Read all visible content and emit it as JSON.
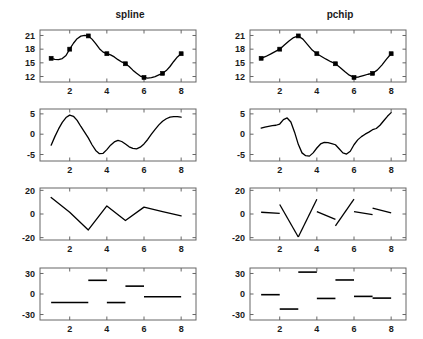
{
  "figure": {
    "width": 423,
    "height": 339,
    "background": "#ffffff",
    "line_color": "#000000",
    "axis_color": "#666666",
    "marker_color": "#000000"
  },
  "columns": [
    {
      "key": "spline",
      "title": "spline"
    },
    {
      "key": "pchip",
      "title": "pchip"
    }
  ],
  "rows": [
    {
      "key": "value",
      "yticks": [
        12,
        15,
        18,
        21
      ],
      "ylim": [
        10.8,
        22.2
      ]
    },
    {
      "key": "d1",
      "yticks": [
        -5,
        0,
        5
      ],
      "ylim": [
        -6.6,
        6.2
      ]
    },
    {
      "key": "d2",
      "yticks": [
        -20,
        0,
        20
      ],
      "ylim": [
        -22,
        22
      ]
    },
    {
      "key": "d3",
      "yticks": [
        -30,
        0,
        30
      ],
      "ylim": [
        -38,
        38
      ]
    }
  ],
  "xticks": [
    2,
    4,
    6,
    8
  ],
  "xlim": [
    0.4,
    8.8
  ],
  "chart_data": {
    "type": "line",
    "xlabel": "",
    "ylabel": "",
    "grid": false,
    "legend": "none",
    "xlim": [
      0.4,
      8.8
    ],
    "xticks": [
      2,
      4,
      6,
      8
    ],
    "knots": {
      "x": [
        1,
        2,
        3,
        4,
        5,
        6,
        7,
        8
      ],
      "y": [
        16.0,
        18.0,
        20.9,
        17.0,
        14.8,
        11.8,
        12.7,
        17.0
      ]
    },
    "panels": [
      {
        "column": "spline",
        "row": "value",
        "title": "spline",
        "type": "line",
        "ylim": [
          10.8,
          22.2
        ],
        "yticks": [
          12,
          15,
          18,
          21
        ],
        "markers": true,
        "series": [
          {
            "name": "spline interpolant",
            "x": [
              1.0,
              1.2,
              1.4,
              1.6,
              1.8,
              2.0,
              2.2,
              2.4,
              2.6,
              2.8,
              3.0,
              3.2,
              3.4,
              3.6,
              3.8,
              4.0,
              4.2,
              4.4,
              4.6,
              4.8,
              5.0,
              5.2,
              5.4,
              5.6,
              5.8,
              6.0,
              6.2,
              6.4,
              6.6,
              6.8,
              7.0,
              7.2,
              7.4,
              7.6,
              7.8,
              8.0
            ],
            "values": [
              16.0,
              15.75,
              15.72,
              15.95,
              16.6,
              18.0,
              19.3,
              20.3,
              20.85,
              21.0,
              20.9,
              20.2,
              19.2,
              18.1,
              17.35,
              17.0,
              16.75,
              16.3,
              15.7,
              15.2,
              14.8,
              14.2,
              13.4,
              12.7,
              12.1,
              11.8,
              11.65,
              11.75,
              12.0,
              12.35,
              12.7,
              13.3,
              14.2,
              15.3,
              16.3,
              17.0
            ]
          }
        ]
      },
      {
        "column": "pchip",
        "row": "value",
        "title": "pchip",
        "type": "line",
        "ylim": [
          10.8,
          22.2
        ],
        "yticks": [
          12,
          15,
          18,
          21
        ],
        "markers": true,
        "series": [
          {
            "name": "pchip interpolant",
            "x": [
              1.0,
              1.25,
              1.5,
              1.75,
              2.0,
              2.25,
              2.5,
              2.75,
              3.0,
              3.25,
              3.5,
              3.75,
              4.0,
              4.25,
              4.5,
              4.75,
              5.0,
              5.25,
              5.5,
              5.75,
              6.0,
              6.25,
              6.5,
              6.75,
              7.0,
              7.25,
              7.5,
              7.75,
              8.0
            ],
            "values": [
              16.0,
              16.4,
              16.9,
              17.45,
              18.0,
              18.9,
              19.8,
              20.55,
              20.9,
              20.2,
              19.0,
              17.8,
              17.0,
              16.4,
              15.8,
              15.25,
              14.8,
              14.0,
              13.1,
              12.3,
              11.8,
              11.9,
              12.2,
              12.5,
              12.7,
              13.4,
              14.5,
              15.8,
              17.0
            ]
          }
        ]
      },
      {
        "column": "spline",
        "row": "d1",
        "type": "line",
        "ylim": [
          -6.6,
          6.2
        ],
        "yticks": [
          -5,
          0,
          5
        ],
        "markers": false,
        "series": [
          {
            "name": "first derivative",
            "x": [
              1.0,
              1.2,
              1.4,
              1.6,
              1.8,
              2.0,
              2.2,
              2.4,
              2.6,
              2.8,
              3.0,
              3.2,
              3.4,
              3.6,
              3.8,
              4.0,
              4.2,
              4.4,
              4.6,
              4.8,
              5.0,
              5.2,
              5.4,
              5.6,
              5.8,
              6.0,
              6.2,
              6.4,
              6.6,
              6.8,
              7.0,
              7.2,
              7.4,
              7.6,
              7.8,
              8.0
            ],
            "values": [
              -2.7,
              -0.6,
              1.3,
              2.9,
              4.1,
              4.7,
              4.4,
              3.4,
              1.9,
              0.5,
              -0.9,
              -2.6,
              -4.0,
              -4.8,
              -4.7,
              -3.8,
              -2.7,
              -1.9,
              -1.5,
              -1.8,
              -2.4,
              -3.1,
              -3.5,
              -3.6,
              -3.2,
              -2.4,
              -1.3,
              0.0,
              1.2,
              2.3,
              3.2,
              3.8,
              4.2,
              4.3,
              4.3,
              4.2
            ]
          }
        ]
      },
      {
        "column": "pchip",
        "row": "d1",
        "type": "line",
        "ylim": [
          -6.6,
          6.2
        ],
        "yticks": [
          -5,
          0,
          5
        ],
        "markers": false,
        "series": [
          {
            "name": "first derivative",
            "x": [
              1.0,
              1.2,
              1.4,
              1.6,
              1.8,
              2.0,
              2.2,
              2.4,
              2.6,
              2.8,
              3.0,
              3.2,
              3.4,
              3.6,
              3.8,
              4.0,
              4.2,
              4.4,
              4.6,
              4.8,
              5.0,
              5.2,
              5.4,
              5.6,
              5.8,
              6.0,
              6.2,
              6.4,
              6.6,
              6.8,
              7.0,
              7.2,
              7.4,
              7.6,
              7.8,
              8.0
            ],
            "values": [
              1.5,
              1.75,
              1.95,
              2.1,
              2.2,
              2.5,
              3.6,
              4.0,
              3.0,
              0.5,
              -2.5,
              -4.6,
              -5.3,
              -5.4,
              -4.6,
              -3.4,
              -2.4,
              -2.0,
              -2.1,
              -2.3,
              -2.6,
              -3.6,
              -4.6,
              -4.9,
              -4.2,
              -2.6,
              -1.4,
              -0.6,
              0.0,
              0.5,
              1.1,
              1.4,
              2.2,
              3.3,
              4.4,
              5.3
            ]
          }
        ]
      },
      {
        "column": "spline",
        "row": "d2",
        "type": "line",
        "ylim": [
          -22,
          22
        ],
        "yticks": [
          -20,
          0,
          20
        ],
        "markers": false,
        "note": "piecewise linear and continuous",
        "series": [
          {
            "name": "second derivative",
            "x": [
              1,
              2,
              3,
              4,
              5,
              6,
              7,
              8
            ],
            "values": [
              14.0,
              1.5,
              -13.5,
              6.8,
              -5.5,
              5.8,
              2.0,
              -1.5
            ]
          }
        ]
      },
      {
        "column": "pchip",
        "row": "d2",
        "type": "segments",
        "ylim": [
          -22,
          22
        ],
        "yticks": [
          -20,
          0,
          20
        ],
        "markers": false,
        "note": "piecewise linear and discontinuous at knots",
        "segments": [
          {
            "x0": 1,
            "y0": 1.5,
            "x1": 2,
            "y1": 0.5
          },
          {
            "x0": 2,
            "y0": 8.0,
            "x1": 3,
            "y1": -19.5
          },
          {
            "x0": 3,
            "y0": -19.5,
            "x1": 4,
            "y1": 12.5
          },
          {
            "x0": 4,
            "y0": 2.0,
            "x1": 5,
            "y1": -4.5
          },
          {
            "x0": 5,
            "y0": -10.0,
            "x1": 6,
            "y1": 12.5
          },
          {
            "x0": 6,
            "y0": 2.0,
            "x1": 7,
            "y1": -0.5
          },
          {
            "x0": 7,
            "y0": 5.0,
            "x1": 8,
            "y1": 1.0
          }
        ]
      },
      {
        "column": "spline",
        "row": "d3",
        "type": "steps",
        "ylim": [
          -38,
          38
        ],
        "yticks": [
          -30,
          0,
          30
        ],
        "markers": false,
        "note": "piecewise constant",
        "segments": [
          {
            "x0": 1,
            "x1": 3,
            "y": -12.5
          },
          {
            "x0": 3,
            "x1": 4,
            "y": 20.0
          },
          {
            "x0": 4,
            "x1": 5,
            "y": -12.5
          },
          {
            "x0": 5,
            "x1": 6,
            "y": 11.5
          },
          {
            "x0": 6,
            "x1": 8,
            "y": -4.0
          }
        ]
      },
      {
        "column": "pchip",
        "row": "d3",
        "type": "steps",
        "ylim": [
          -38,
          38
        ],
        "yticks": [
          -30,
          0,
          30
        ],
        "markers": false,
        "note": "piecewise constant",
        "segments": [
          {
            "x0": 1,
            "x1": 2,
            "y": -1.0
          },
          {
            "x0": 2,
            "x1": 3,
            "y": -22.0
          },
          {
            "x0": 3,
            "x1": 4,
            "y": 32.0
          },
          {
            "x0": 4,
            "x1": 5,
            "y": -6.5
          },
          {
            "x0": 5,
            "x1": 6,
            "y": 20.5
          },
          {
            "x0": 6,
            "x1": 7,
            "y": -3.5
          },
          {
            "x0": 7,
            "x1": 8,
            "y": -6.0
          }
        ]
      }
    ]
  }
}
